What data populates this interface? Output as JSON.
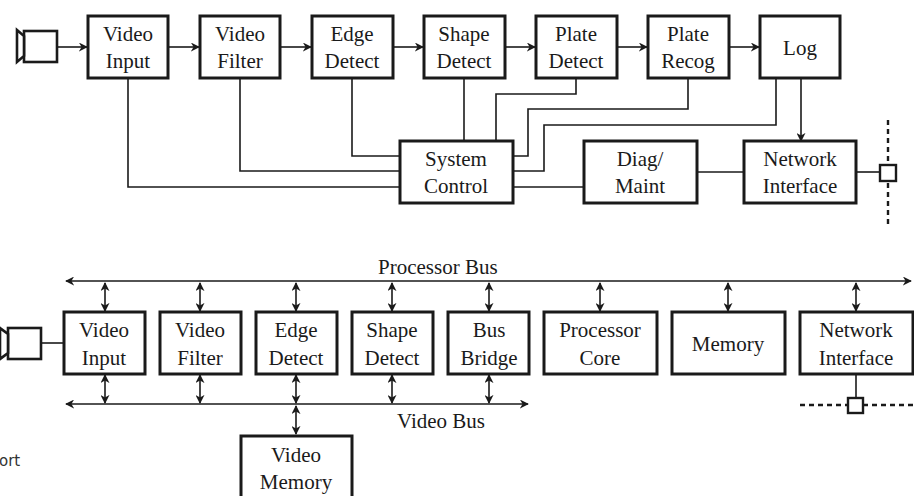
{
  "top_diagram": {
    "blocks": [
      {
        "id": "video-input",
        "line1": "Video",
        "line2": "Input"
      },
      {
        "id": "video-filter",
        "line1": "Video",
        "line2": "Filter"
      },
      {
        "id": "edge-detect",
        "line1": "Edge",
        "line2": "Detect"
      },
      {
        "id": "shape-detect",
        "line1": "Shape",
        "line2": "Detect"
      },
      {
        "id": "plate-detect",
        "line1": "Plate",
        "line2": "Detect"
      },
      {
        "id": "plate-recog",
        "line1": "Plate",
        "line2": "Recog"
      },
      {
        "id": "log",
        "line1": "Log",
        "line2": ""
      },
      {
        "id": "system-control",
        "line1": "System",
        "line2": "Control"
      },
      {
        "id": "diag-maint",
        "line1": "Diag/",
        "line2": "Maint"
      },
      {
        "id": "network-interface",
        "line1": "Network",
        "line2": "Interface"
      }
    ]
  },
  "bottom_diagram": {
    "processor_bus_label": "Processor Bus",
    "video_bus_label": "Video Bus",
    "blocks": [
      {
        "id": "video-input",
        "line1": "Video",
        "line2": "Input"
      },
      {
        "id": "video-filter",
        "line1": "Video",
        "line2": "Filter"
      },
      {
        "id": "edge-detect",
        "line1": "Edge",
        "line2": "Detect"
      },
      {
        "id": "shape-detect",
        "line1": "Shape",
        "line2": "Detect"
      },
      {
        "id": "bus-bridge",
        "line1": "Bus",
        "line2": "Bridge"
      },
      {
        "id": "processor-core",
        "line1": "Processor",
        "line2": "Core"
      },
      {
        "id": "memory",
        "line1": "Memory",
        "line2": ""
      },
      {
        "id": "network-interface",
        "line1": "Network",
        "line2": "Interface"
      },
      {
        "id": "video-memory",
        "line1": "Video",
        "line2": "Memory"
      }
    ]
  },
  "side_text": "ort"
}
